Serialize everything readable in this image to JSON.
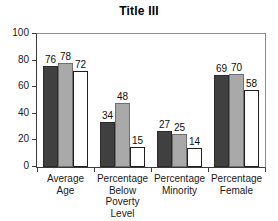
{
  "chart_data": {
    "type": "bar",
    "title": "Title III",
    "xlabel": "",
    "ylabel": "",
    "ylim": [
      0,
      100
    ],
    "yticks": [
      0,
      20,
      40,
      60,
      80,
      100
    ],
    "grid": false,
    "legend": "none",
    "categories": [
      "Average\nAge",
      "Percentage\nBelow\nPoverty\nLevel",
      "Percentage\nMinority",
      "Percentage\nFemale"
    ],
    "category_lines": [
      [
        "Average",
        "Age"
      ],
      [
        "Percentage",
        "Below",
        "Poverty",
        "Level"
      ],
      [
        "Percentage",
        "Minority"
      ],
      [
        "Percentage",
        "Female"
      ]
    ],
    "series": [
      {
        "name": "Series 1",
        "color": "#404040",
        "values": [
          76,
          34,
          27,
          69
        ]
      },
      {
        "name": "Series 2",
        "color": "#a9a9a9",
        "values": [
          78,
          48,
          25,
          70
        ]
      },
      {
        "name": "Series 3",
        "color": "#ffffff",
        "values": [
          72,
          15,
          14,
          58
        ]
      }
    ],
    "data_labels": [
      [
        "76",
        "78",
        "72"
      ],
      [
        "34",
        "48",
        "15"
      ],
      [
        "27",
        "25",
        "14"
      ],
      [
        "69",
        "70",
        "58"
      ]
    ],
    "colors": {
      "series1": "#404040",
      "series2": "#a9a9a9",
      "series3": "#ffffff",
      "axis": "#3a3a3a",
      "frame": "#8d8d8d",
      "background": "#ffffff",
      "text": "#1a1a1a"
    }
  }
}
